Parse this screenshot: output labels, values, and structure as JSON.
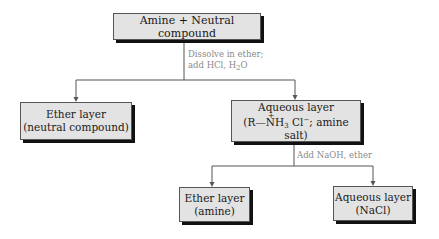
{
  "diagram": {
    "nodes": {
      "start": {
        "label": "Amine + Neutral compound"
      },
      "ether1": {
        "line1": "Ether layer",
        "line2": "(neutral compound)"
      },
      "aqueous1": {
        "line1": "Aqueous layer",
        "r": "(R",
        "bond": "—",
        "n": "N",
        "plus": "+",
        "h": "H",
        "h_sub": "3",
        "cl": " Cl",
        "cl_sup": "−",
        "rest": "; amine salt)"
      },
      "ether2": {
        "line1": "Ether layer",
        "line2": "(amine)"
      },
      "aqueous2": {
        "line1": "Aqueous layer",
        "line2": "(NaCl)"
      }
    },
    "steps": {
      "step1": {
        "line1": "Dissolve in ether;",
        "line2_a": "add HCl, H",
        "line2_sub": "2",
        "line2_b": "O"
      },
      "step2": {
        "label": "Add NaOH, ether"
      }
    },
    "colors": {
      "box_fill": "#e3e3e3",
      "shadow": "#111111",
      "note_text": "#8a8a8a",
      "line": "#555555"
    }
  }
}
